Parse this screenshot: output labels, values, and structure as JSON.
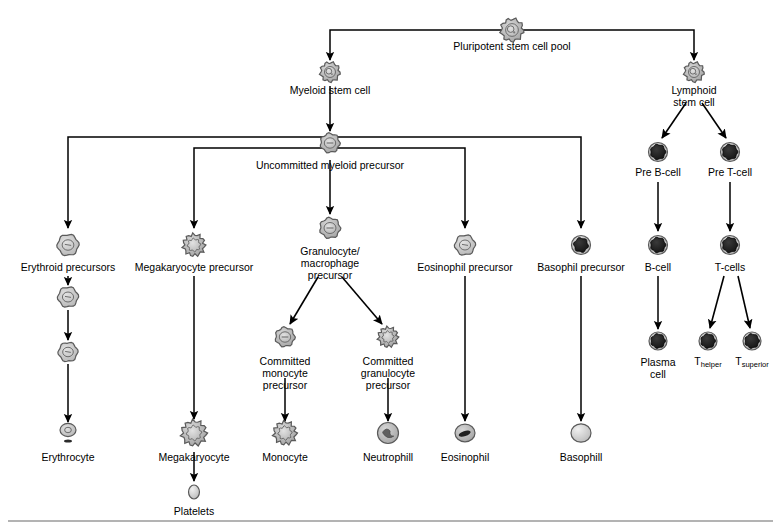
{
  "diagram": {
    "colors": {
      "line": "#000000",
      "cell_fill_light": "#c8c8c8",
      "cell_fill_mid": "#a8a8a8",
      "cell_fill_dark": "#1e1e1e",
      "cell_stroke": "#5a5a5a",
      "rule": "#9a9a9a",
      "background": "#ffffff"
    },
    "nodes": [
      {
        "id": "pluripotent",
        "label": "Pluripotent stem cell pool",
        "x": 512,
        "y": 30,
        "label_x": 512,
        "label_y": 47,
        "icon": "stem-cell",
        "icon_size": 22
      },
      {
        "id": "myeloid-stem",
        "label": "Myeloid stem cell",
        "x": 330,
        "y": 72,
        "label_x": 330,
        "label_y": 91,
        "icon": "stem-cell",
        "icon_size": 19
      },
      {
        "id": "lymphoid-stem",
        "label": "Lymphoid\nstem cell",
        "x": 694,
        "y": 72,
        "label_x": 694,
        "label_y": 91,
        "icon": "stem-cell",
        "icon_size": 19
      },
      {
        "id": "uncommitted",
        "label": "Uncommitted myeloid precursor",
        "x": 330,
        "y": 143,
        "label_x": 330,
        "label_y": 166,
        "icon": "ringed-cell",
        "icon_size": 19
      },
      {
        "id": "pre-b-cell",
        "label": "Pre B-cell",
        "x": 658,
        "y": 152,
        "label_x": 658,
        "label_y": 173,
        "icon": "dark-lymphocyte",
        "icon_size": 19
      },
      {
        "id": "pre-t-cell",
        "label": "Pre T-cell",
        "x": 730,
        "y": 152,
        "label_x": 730,
        "label_y": 173,
        "icon": "dark-lymphocyte",
        "icon_size": 19
      },
      {
        "id": "erythroid-prec",
        "label": "Erythroid precursors",
        "x": 68,
        "y": 245,
        "label_x": 68,
        "label_y": 268,
        "icon": "pale-cell",
        "icon_size": 21
      },
      {
        "id": "megakaryocyte-prec",
        "label": "Megakaryocyte precursor",
        "x": 194,
        "y": 245,
        "label_x": 194,
        "label_y": 268,
        "icon": "lobed-cell",
        "icon_size": 21
      },
      {
        "id": "granulocyte-macro",
        "label": "Granulocyte/\nmacrophage\nprecursor",
        "x": 330,
        "y": 228,
        "label_x": 330,
        "label_y": 252,
        "icon": "ringed-cell",
        "icon_size": 20
      },
      {
        "id": "eosinophil-prec",
        "label": "Eosinophil precursor",
        "x": 465,
        "y": 245,
        "label_x": 465,
        "label_y": 268,
        "icon": "pale-cell",
        "icon_size": 20
      },
      {
        "id": "basophil-prec",
        "label": "Basophil precursor",
        "x": 581,
        "y": 245,
        "label_x": 581,
        "label_y": 268,
        "icon": "dark-granular",
        "icon_size": 19
      },
      {
        "id": "b-cell",
        "label": "B-cell",
        "x": 658,
        "y": 245,
        "label_x": 658,
        "label_y": 268,
        "icon": "dark-lymphocyte",
        "icon_size": 19
      },
      {
        "id": "t-cells",
        "label": "T-cells",
        "x": 730,
        "y": 245,
        "label_x": 730,
        "label_y": 268,
        "icon": "dark-lymphocyte",
        "icon_size": 19
      },
      {
        "id": "erythroid-2",
        "label": "",
        "x": 68,
        "y": 297,
        "icon": "pale-cell",
        "icon_size": 20
      },
      {
        "id": "erythroid-3",
        "label": "",
        "x": 68,
        "y": 352,
        "icon": "pale-cell",
        "icon_size": 19
      },
      {
        "id": "committed-mono",
        "label": "Committed\nmonocyte\nprecursor",
        "x": 285,
        "y": 337,
        "label_x": 285,
        "label_y": 362,
        "icon": "ringed-cell",
        "icon_size": 19
      },
      {
        "id": "committed-gran",
        "label": "Committed\ngranulocyte\nprecursor",
        "x": 388,
        "y": 337,
        "label_x": 388,
        "label_y": 362,
        "icon": "lobed-cell",
        "icon_size": 19
      },
      {
        "id": "plasma-cell",
        "label": "Plasma\ncell",
        "x": 658,
        "y": 341,
        "label_x": 658,
        "label_y": 363,
        "icon": "dark-lymphocyte",
        "icon_size": 18
      },
      {
        "id": "t-helper",
        "label": "T",
        "sub": "helper",
        "x": 708,
        "y": 341,
        "label_x": 708,
        "label_y": 362,
        "icon": "dark-lymphocyte",
        "icon_size": 18
      },
      {
        "id": "t-superior",
        "label": "T",
        "sub": "superior",
        "x": 752,
        "y": 341,
        "label_x": 752,
        "label_y": 362,
        "icon": "dark-lymphocyte",
        "icon_size": 18
      },
      {
        "id": "erythrocyte",
        "label": "Erythrocyte",
        "x": 68,
        "y": 433,
        "label_x": 68,
        "label_y": 458,
        "icon": "erythrocyte",
        "icon_size": 16
      },
      {
        "id": "megakaryocyte",
        "label": "Megakaryocyte",
        "x": 194,
        "y": 433,
        "label_x": 194,
        "label_y": 458,
        "icon": "lobed-cell",
        "icon_size": 24
      },
      {
        "id": "monocyte",
        "label": "Monocyte",
        "x": 285,
        "y": 433,
        "label_x": 285,
        "label_y": 458,
        "icon": "lobed-cell",
        "icon_size": 22
      },
      {
        "id": "neutrophill",
        "label": "Neutrophill",
        "x": 388,
        "y": 433,
        "label_x": 388,
        "label_y": 458,
        "icon": "neutrophil",
        "icon_size": 21
      },
      {
        "id": "eosinophil",
        "label": "Eosinophil",
        "x": 465,
        "y": 433,
        "label_x": 465,
        "label_y": 458,
        "icon": "eosinophil",
        "icon_size": 20
      },
      {
        "id": "basophill",
        "label": "Basophill",
        "x": 581,
        "y": 433,
        "label_x": 581,
        "label_y": 458,
        "icon": "pale-round",
        "icon_size": 20
      },
      {
        "id": "platelets",
        "label": "Platelets",
        "x": 194,
        "y": 492,
        "label_x": 194,
        "label_y": 512,
        "icon": "platelet",
        "icon_size": 14
      }
    ],
    "edges": [
      {
        "id": "pluripotent-to-myeloid",
        "type": "elbow-left",
        "points": "512,30 330,30 330,60",
        "arrow": true
      },
      {
        "id": "pluripotent-to-lymphoid",
        "type": "elbow-right",
        "points": "512,30 694,30 694,60",
        "arrow": true
      },
      {
        "id": "myeloid-to-uncommitted",
        "type": "straight",
        "points": "330,86 330,131",
        "arrow": true
      },
      {
        "id": "uncommitted-to-erythroid",
        "type": "elbow",
        "points": "330,137 68,137 68,228",
        "arrow": true
      },
      {
        "id": "uncommitted-to-megakaryo",
        "type": "elbow",
        "points": "330,148 194,148 194,228",
        "arrow": true
      },
      {
        "id": "uncommitted-to-granulocyte",
        "type": "straight",
        "points": "330,160 330,214",
        "arrow": true
      },
      {
        "id": "uncommitted-to-eosinophil",
        "type": "elbow",
        "points": "330,148 465,148 465,228",
        "arrow": true
      },
      {
        "id": "uncommitted-to-basophil",
        "type": "elbow",
        "points": "330,137 581,137 581,228",
        "arrow": true
      },
      {
        "id": "lymphoid-to-pre-b",
        "type": "diagonal",
        "points": "686,103 662,138",
        "arrow": true
      },
      {
        "id": "lymphoid-to-pre-t",
        "type": "diagonal",
        "points": "702,103 726,138",
        "arrow": true
      },
      {
        "id": "pre-b-to-b-cell",
        "type": "straight",
        "points": "658,182 658,231",
        "arrow": true
      },
      {
        "id": "pre-t-to-t-cells",
        "type": "straight",
        "points": "730,182 730,231",
        "arrow": true
      },
      {
        "id": "erythroid-1-to-2",
        "type": "straight",
        "points": "68,276 68,285",
        "arrow": true
      },
      {
        "id": "erythroid-2-to-3",
        "type": "straight",
        "points": "68,310 68,340",
        "arrow": true
      },
      {
        "id": "erythroid-3-to-erythrocyte",
        "type": "straight",
        "points": "68,364 68,422",
        "arrow": true
      },
      {
        "id": "megakaryo-prec-to-mature",
        "type": "straight",
        "points": "194,276 194,419",
        "arrow": true
      },
      {
        "id": "granulo-to-committed-mono",
        "type": "diagonal",
        "points": "318,277 290,324",
        "arrow": true
      },
      {
        "id": "granulo-to-committed-gran",
        "type": "diagonal",
        "points": "342,277 382,324",
        "arrow": true
      },
      {
        "id": "committed-mono-to-monocyte",
        "type": "straight",
        "points": "285,378 285,421",
        "arrow": true
      },
      {
        "id": "committed-gran-to-neutro",
        "type": "straight",
        "points": "388,378 388,421",
        "arrow": true
      },
      {
        "id": "eosinophil-prec-to-mature",
        "type": "straight",
        "points": "465,276 465,421",
        "arrow": true
      },
      {
        "id": "basophil-prec-to-mature",
        "type": "straight",
        "points": "581,276 581,421",
        "arrow": true
      },
      {
        "id": "b-cell-to-plasma",
        "type": "straight",
        "points": "658,276 658,329",
        "arrow": true
      },
      {
        "id": "t-cells-to-helper",
        "type": "diagonal",
        "points": "724,276 710,328",
        "arrow": true
      },
      {
        "id": "t-cells-to-superior",
        "type": "diagonal",
        "points": "738,276 750,328",
        "arrow": true
      },
      {
        "id": "megakaryocyte-to-platelets",
        "type": "straight",
        "points": "194,452 194,481",
        "arrow": true
      }
    ],
    "rule": {
      "id": "bottom-rule",
      "x1": 8,
      "y1": 521,
      "x2": 773,
      "y2": 521
    }
  }
}
